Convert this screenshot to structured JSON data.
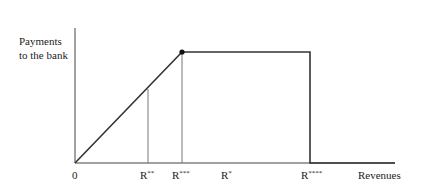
{
  "diagram": {
    "y_axis_label_line1": "Payments",
    "y_axis_label_line2": "to the bank",
    "x_axis_label": "Revenues",
    "origin_label": "0",
    "ticks": [
      {
        "base": "R",
        "sup": "**",
        "x": 148
      },
      {
        "base": "R",
        "sup": "***",
        "x": 182
      },
      {
        "base": "R",
        "sup": "*",
        "x": 226
      },
      {
        "base": "R",
        "sup": "****",
        "x": 310
      }
    ],
    "colors": {
      "axis": "#444444",
      "curve": "#333333",
      "guide": "#777777"
    }
  }
}
